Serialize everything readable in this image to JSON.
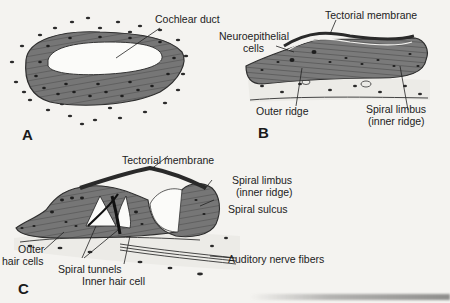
{
  "figure": {
    "panels": [
      {
        "letter": "A",
        "labels": {
          "cochlear_duct": "Cochlear duct"
        }
      },
      {
        "letter": "B",
        "labels": {
          "tectorial_membrane": "Tectorial membrane",
          "neuroepithelial_1": "Neuroepithelial",
          "neuroepithelial_2": "cells",
          "outer_ridge": "Outer ridge",
          "spiral_limbus_1": "Spiral limbus",
          "spiral_limbus_2": "(inner ridge)"
        }
      },
      {
        "letter": "C",
        "labels": {
          "tectorial_membrane": "Tectorial membrane",
          "spiral_limbus_1": "Spiral limbus",
          "spiral_limbus_2": "(inner ridge)",
          "spiral_sulcus": "Spiral sulcus",
          "outer_hair_1": "Outer",
          "outer_hair_2": "hair cells",
          "spiral_tunnels": "Spiral tunnels",
          "inner_hair_cell": "Inner hair cell",
          "auditory_nerve": "Auditory nerve fibers"
        }
      }
    ]
  },
  "colors": {
    "paper": "#f4f3f0",
    "tissue": "#6e6e6e",
    "tissue_dark": "#3a3a3a",
    "lumen": "#fbfbf9",
    "ink": "#1c1c1c"
  }
}
